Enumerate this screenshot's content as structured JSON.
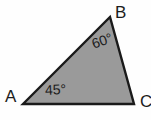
{
  "figure": {
    "type": "geometry-diagram",
    "shape": "triangle",
    "canvas": {
      "width": 151,
      "height": 120
    },
    "background_color": "#fefefe",
    "fill_color": "#9a9a9a",
    "stroke_color": "#1a1a1a",
    "stroke_width": 2,
    "vertices": [
      {
        "name": "A",
        "label": "A",
        "x": 23,
        "y": 104
      },
      {
        "name": "B",
        "label": "B",
        "x": 110,
        "y": 17
      },
      {
        "name": "C",
        "label": "C",
        "x": 134,
        "y": 104
      }
    ],
    "polygon_points": "23,104 110,17 134,104",
    "angles": [
      {
        "at_vertex": "A",
        "label": "45°",
        "value": 45,
        "unit": "degrees"
      },
      {
        "at_vertex": "B",
        "label": "60°",
        "value": 60,
        "unit": "degrees"
      },
      {
        "at_vertex": "C",
        "label": "",
        "value": 75,
        "unit": "degrees"
      }
    ]
  }
}
